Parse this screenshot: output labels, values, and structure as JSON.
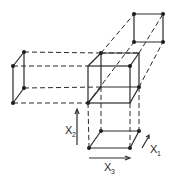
{
  "diagram": {
    "axes": [
      {
        "label": "X",
        "subscript": "1"
      },
      {
        "label": "X",
        "subscript": "2"
      },
      {
        "label": "X",
        "subscript": "3"
      }
    ],
    "colors": {
      "line": "#2a2a2a",
      "background": "#ffffff"
    }
  }
}
